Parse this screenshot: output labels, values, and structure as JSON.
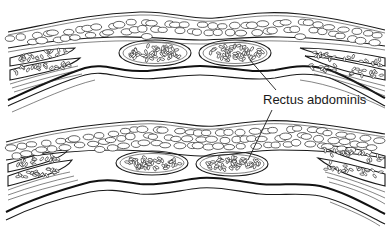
{
  "figure": {
    "panels": [
      {
        "id": "top",
        "description": "Abdominal wall cross-section (upper)"
      },
      {
        "id": "bottom",
        "description": "Abdominal wall cross-section (lower)"
      }
    ],
    "labels": [
      {
        "text": "Rectus abdominis",
        "points_to": [
          "top-right-rectus",
          "bottom-left-rectus"
        ]
      }
    ],
    "colors": {
      "ink": "#1a1a1a",
      "background": "#ffffff"
    }
  }
}
